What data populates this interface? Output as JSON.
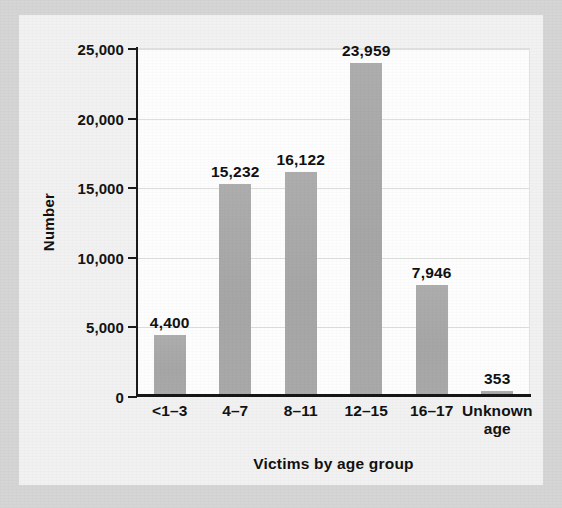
{
  "chart_data": {
    "type": "bar",
    "title": "",
    "categories": [
      "<1–3",
      "4–7",
      "8–11",
      "12–15",
      "16–17",
      "Unknown age"
    ],
    "values": [
      4400,
      15232,
      16122,
      23959,
      7946,
      353
    ],
    "value_labels": [
      "4,400",
      "15,232",
      "16,122",
      "23,959",
      "7,946",
      "353"
    ],
    "xlabel": "Victims by age group",
    "ylabel": "Number",
    "ylim": [
      0,
      25000
    ],
    "ytick_values": [
      0,
      5000,
      10000,
      15000,
      20000,
      25000
    ],
    "ytick_labels": [
      "0",
      "5,000",
      "10,000",
      "15,000",
      "20,000",
      "25,000"
    ],
    "grid": "horizontal",
    "legend": "none",
    "bar_color": "#a9a9a9",
    "plot_background": "#fdfdfd",
    "figure_background": "#efefef",
    "axis_color": "#1b1b1b",
    "gridline_color": "#dededd",
    "text_color": "#111111"
  }
}
